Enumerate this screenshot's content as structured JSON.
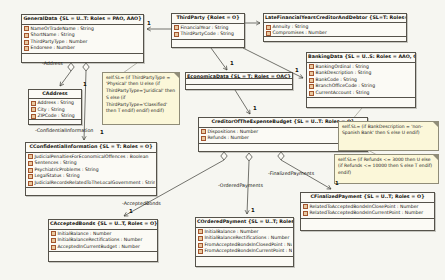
{
  "colors": {
    "class_fill": "#fbfaf5",
    "class_border": "#55524a",
    "note_fill": "#fbf7d9",
    "note_border": "#8f8c78",
    "icon_border": "#a3552e",
    "icon_fill": "#e9c9a0",
    "edge_line": "#3a3a33"
  },
  "classes": [
    {
      "id": "general-data",
      "title": "GeneralData {SL = U..T: Roles = PAO, AAO}",
      "attributes": [
        "NameOrTradeName : String",
        "ShortName : String",
        "ThirdPartyType : Number",
        "Endorsee : Number"
      ]
    },
    {
      "id": "third-party",
      "title": "ThirdParty {Roles = O}",
      "attributes": [
        "FinancialYear : String",
        "ThirdPartyCode : String"
      ]
    },
    {
      "id": "late-financial",
      "title": "LateFinancialYearsCreditorAndDebtor {SL=T: Roles=o}",
      "attributes": [
        "Annuity : String",
        "Compromises : Number"
      ]
    },
    {
      "id": "banking-data",
      "title": "BankingData {SL = U..S: Roles = AAO, OAC}",
      "attributes": [
        "BankingOrdinal : String",
        "BankDescription : String",
        "BankCode : String",
        "BranchOfficeCode : String",
        "CurrentAccount : String"
      ]
    },
    {
      "id": "c-address",
      "title": "CAddress",
      "attributes": [
        "Address : String",
        "City : String",
        "ZIPCode : String"
      ]
    },
    {
      "id": "economica-data",
      "title": "EconomicaData {SL = T: Roles = OAC}",
      "attributes": []
    },
    {
      "id": "c-confidential-information",
      "title": "CConfidentialInformation {SL = T: Roles = O}",
      "attributes": [
        "JudicialPenaltiesForEconomicalOffences : Boolean",
        "Sentences : String",
        "PsychiatricProblems : String",
        "LegalStatus : String",
        "JudicialRecordsRelatedToTheLocalGovernment : String"
      ]
    },
    {
      "id": "creditor-expense-budget",
      "title": "CreditorOfTheExpenseBudget {SL = U..T: Roles = O}",
      "attributes": [
        "Dispositions : Number",
        "Refunds : Number"
      ]
    },
    {
      "id": "c-accepted-bonds",
      "title": "CAcceptedBonds {SL = U..T, Roles = O}",
      "attributes": [
        "InitialBalance : Number",
        "InitialBalanceRectifications : Number",
        "AcceptedInCurrentBudget : Number"
      ]
    },
    {
      "id": "c-ordered-payment",
      "title": "COrderedPayment {SL = U..T; Roles = O}",
      "attributes": [
        "InitialBalance : Number",
        "InitialBalanceRectifications : Number",
        "FromAcceptedBondsInClosedPoint : Number",
        "FromAcceptedBondsInCurrentPoint : Number"
      ]
    },
    {
      "id": "c-finalized-payment",
      "title": "CFinalizedPayment {SL = U..T; Roles = O}",
      "attributes": [
        "RelatedToAcceptedBondsInClosePoint : Number",
        "RelatedToAcceptedBondsInCurrentPoint : Number"
      ]
    }
  ],
  "notes": [
    {
      "id": "note-thirdpartytype",
      "text": "self.SL= (if ThirdPartyType = 'Physical' then U else (if ThirdPartyType='Juridical' then S else (if ThirdPartyType='Classified' then T endif) endif) endif)"
    },
    {
      "id": "note-bankdescription",
      "text": "self.SL= (if BankDescription = 'non-Spanish Bank' then S else U endif)"
    },
    {
      "id": "note-refunds",
      "text": "self.SL= (if Refunds <= 3000 then U else (if Refunds <= 10000 then S else T endif) endif)"
    }
  ],
  "labels": [
    {
      "id": "mult-generaldata",
      "text": "1"
    },
    {
      "id": "mult-economicadata",
      "text": "1"
    },
    {
      "id": "mult-bankingdata",
      "text": "1"
    },
    {
      "id": "mult-creditorbudget",
      "text": "1"
    },
    {
      "id": "mult-caddress",
      "text": "1"
    },
    {
      "id": "mult-confidentialinformation",
      "text": "1"
    },
    {
      "id": "mult-acceptedbonds",
      "text": "1"
    },
    {
      "id": "mult-orderedpayment",
      "text": "1"
    },
    {
      "id": "mult-finalizedpayment",
      "text": "1"
    },
    {
      "id": "role-address",
      "text": "-Address"
    },
    {
      "id": "role-confidentialinformation",
      "text": "-ConfidentialInformation"
    },
    {
      "id": "role-acceptedbonds",
      "text": "-AcceptedBonds"
    },
    {
      "id": "role-orderedpayments",
      "text": "-OrderedPayments"
    },
    {
      "id": "role-finalizedpayments",
      "text": "-FinalizedPayments"
    }
  ]
}
